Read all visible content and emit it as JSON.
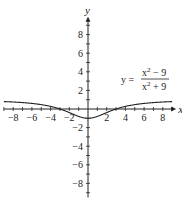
{
  "chart_data": {
    "type": "line",
    "title": "",
    "xlabel": "x",
    "ylabel": "y",
    "xlim": [
      -9,
      9
    ],
    "ylim": [
      -9.5,
      9.5
    ],
    "grid": false,
    "x_ticks": [
      -8,
      -6,
      -4,
      -2,
      2,
      4,
      6,
      8
    ],
    "x_tick_labels": [
      "−8",
      "−6",
      "−4",
      "−2",
      "2",
      "4",
      "6",
      "8"
    ],
    "y_ticks": [
      8,
      6,
      4,
      2,
      -2,
      -4,
      -6,
      -8
    ],
    "y_tick_labels": [
      "8",
      "6",
      "4",
      "2",
      "−2",
      "−4",
      "−6",
      "−8"
    ],
    "annotation": {
      "lhs": "y =",
      "numerator_base": "x",
      "numerator_exp": "2",
      "numerator_rest": " − 9",
      "denominator_base": "x",
      "denominator_exp": "2",
      "denominator_rest": " + 9"
    },
    "series": [
      {
        "name": "y = (x^2 - 9)/(x^2 + 9)",
        "x": [
          -9,
          -8,
          -7,
          -6,
          -5,
          -4,
          -3,
          -2,
          -1,
          0,
          1,
          2,
          3,
          4,
          5,
          6,
          7,
          8,
          9
        ],
        "y": [
          0.8,
          0.754,
          0.689,
          0.6,
          0.471,
          0.28,
          0,
          -0.385,
          -0.8,
          -1,
          -0.8,
          -0.385,
          0,
          0.28,
          0.471,
          0.6,
          0.689,
          0.754,
          0.8
        ]
      }
    ]
  }
}
